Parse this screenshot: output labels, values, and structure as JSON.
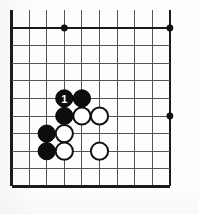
{
  "figure": {
    "kind": "go-board-diagram",
    "board": {
      "columns": 10,
      "rows": 10,
      "origin_x": 11.5,
      "origin_y": 28.0,
      "spacing": 17.6,
      "top_partial_row": true,
      "top_partial_y": 10.0,
      "line_color": "#2b2b2b",
      "edge_color": "#1a1a1a",
      "background_color": "#fdfdfb"
    },
    "star_points": [
      {
        "col": 3,
        "row": 0
      },
      {
        "col": 9,
        "row": 0
      },
      {
        "col": 9,
        "row": 5
      }
    ],
    "stones": [
      {
        "col": 3,
        "row": 4,
        "color": "black",
        "label": "1"
      },
      {
        "col": 4,
        "row": 4,
        "color": "black",
        "label": ""
      },
      {
        "col": 3,
        "row": 5,
        "color": "black",
        "label": ""
      },
      {
        "col": 4,
        "row": 5,
        "color": "white",
        "label": ""
      },
      {
        "col": 5,
        "row": 5,
        "color": "white",
        "label": ""
      },
      {
        "col": 2,
        "row": 6,
        "color": "black",
        "label": ""
      },
      {
        "col": 3,
        "row": 6,
        "color": "white",
        "label": ""
      },
      {
        "col": 2,
        "row": 7,
        "color": "black",
        "label": ""
      },
      {
        "col": 3,
        "row": 7,
        "color": "white",
        "label": ""
      },
      {
        "col": 5,
        "row": 7,
        "color": "white",
        "label": ""
      }
    ],
    "stone_radius": 8.6,
    "star_radius": 3.4,
    "colors": {
      "black_stone": "#0d0d0d",
      "white_stone": "#ffffff",
      "white_stone_outline": "#111111",
      "label_text": "#ffffff"
    }
  }
}
